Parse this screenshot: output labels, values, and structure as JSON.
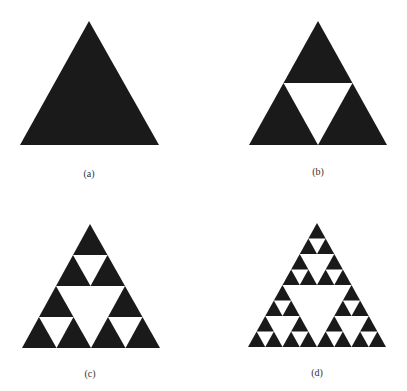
{
  "figure": {
    "fill_color": "#1a1a1a",
    "background": "#ffffff",
    "panels": [
      {
        "label": "(a)",
        "depth": 0,
        "apex": [
          89,
          21
        ],
        "base_left": [
          20,
          145
        ],
        "base_right": [
          159,
          145
        ],
        "label_pos": [
          89,
          168
        ]
      },
      {
        "label": "(b)",
        "depth": 1,
        "apex": [
          318,
          21
        ],
        "base_left": [
          249,
          145
        ],
        "base_right": [
          387,
          145
        ],
        "label_pos": [
          318,
          166
        ]
      },
      {
        "label": "(c)",
        "depth": 2,
        "apex": [
          90,
          224
        ],
        "base_left": [
          22,
          348
        ],
        "base_right": [
          160,
          348
        ],
        "label_pos": [
          90,
          368
        ]
      },
      {
        "label": "(d)",
        "depth": 3,
        "apex": [
          317,
          223
        ],
        "base_left": [
          248,
          347
        ],
        "base_right": [
          386,
          347
        ],
        "label_pos": [
          317,
          367
        ]
      }
    ]
  }
}
